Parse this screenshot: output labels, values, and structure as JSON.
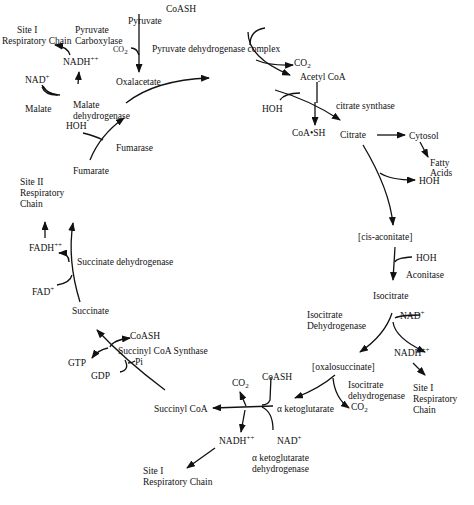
{
  "diagram": {
    "metabolites": {
      "pyruvate": "Pyruvate",
      "oxalacetate": "Oxalacetate",
      "acetyl_coa": "Acetyl CoA",
      "citrate": "Citrate",
      "cis_aconitate": "[cis-aconitate]",
      "isocitrate": "Isocitrate",
      "oxalosuccinate": "[oxalosuccinate]",
      "alpha_ketoglutarate": "α ketoglutarate",
      "succinyl_coa": "Succinyl CoA",
      "succinate": "Succinate",
      "fumarate": "Fumarate",
      "malate": "Malate",
      "cytosol": "Cytosol",
      "fatty_acids_1": "Fatty",
      "fatty_acids_2": "Acids"
    },
    "enzymes": {
      "pyruvate_carboxylase_1": "Pyruvate",
      "pyruvate_carboxylase_2": "Carboxylase",
      "pyruvate_dehydrogenase_complex": "Pyruvate dehydrogenase complex",
      "citrate_synthase": "citrate synthase",
      "aconitase": "Aconitase",
      "isocitrate_dehydrogenase_upper_1": "Isocitrate",
      "isocitrate_dehydrogenase_upper_2": "Dehydrogenase",
      "isocitrate_dehydrogenase_lower_1": "Isocitrate",
      "isocitrate_dehydrogenase_lower_2": "dehydrogenase",
      "akg_dehydrogenase_1": "α ketoglutarate",
      "akg_dehydrogenase_2": "dehydrogenase",
      "succinyl_coa_synthase": "Succinyl CoA Synthase",
      "succinate_dehydrogenase": "Succinate dehydrogenase",
      "fumarase": "Fumarase",
      "malate_dehydrogenase_1": "Malate",
      "malate_dehydrogenase_2": "dehydrogenase"
    },
    "cofactors": {
      "coash_top": "CoASH",
      "co2_top_left": "CO",
      "co2_top_right": "CO",
      "hoh_citrate_synthase": "HOH",
      "coa_sh": "CoA•SH",
      "hoh_citrate": "HOH",
      "hoh_aconitase": "HOH",
      "nad_isocitrate": "NAD",
      "nadh_isocitrate": "NADH",
      "co2_oxalosuccinate": "CO",
      "coash_akg": "CoASH",
      "co2_akg": "CO",
      "nad_akg": "NAD",
      "nadh_akg": "NADH",
      "coash_succinyl": "CoASH",
      "gtp": "GTP",
      "gdp": "GDP",
      "pi": "Pi",
      "fad": "FAD",
      "fadh": "FADH",
      "hoh_fumarase": "HOH",
      "nad_malate": "NAD",
      "nadh_malate": "NADH"
    },
    "superscripts": {
      "plus": "+",
      "plusplus": "++"
    },
    "subscripts": {
      "two": "2"
    },
    "respiratory": {
      "site1_top_1": "Site I",
      "site1_top_2": "Respiratory Chain",
      "site1_right_1": "Site I",
      "site1_right_2": "Respiratory",
      "site1_right_3": "Chain",
      "site1_bottom_1": "Site I",
      "site1_bottom_2": "Respiratory Chain",
      "site2_1": "Site II",
      "site2_2": "Respiratory",
      "site2_3": "Chain"
    }
  }
}
